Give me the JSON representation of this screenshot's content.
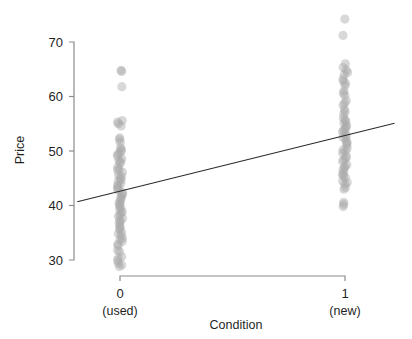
{
  "chart_data": {
    "type": "scatter",
    "title": "",
    "xlabel": "Condition",
    "ylabel": "Price",
    "xlim": [
      -0.22,
      1.26
    ],
    "ylim": [
      27.5,
      75.5
    ],
    "grid": false,
    "legend": null,
    "x_ticks": [
      {
        "value": 0,
        "label": "0",
        "sublabel": "(used)"
      },
      {
        "value": 1,
        "label": "1",
        "sublabel": "(new)"
      }
    ],
    "y_ticks": [
      {
        "value": 30,
        "label": "30"
      },
      {
        "value": 40,
        "label": "40"
      },
      {
        "value": 50,
        "label": "50"
      },
      {
        "value": 60,
        "label": "60"
      },
      {
        "value": 70,
        "label": "70"
      }
    ],
    "point_style": {
      "color": "#a8a8a8",
      "opacity": 0.45,
      "radius": 4.6,
      "jitter_x": 0.012
    },
    "series": [
      {
        "name": "Condition = 0 (used)",
        "x": 0,
        "values": [
          64.8,
          64.6,
          61.8,
          55.6,
          55.3,
          55.0,
          54.6,
          52.4,
          52.1,
          51.6,
          50.6,
          50.3,
          50.0,
          49.7,
          49.4,
          49.1,
          48.6,
          48.3,
          48.0,
          47.7,
          47.0,
          46.7,
          46.4,
          46.1,
          45.6,
          45.3,
          45.0,
          44.7,
          44.4,
          44.0,
          43.7,
          43.4,
          43.1,
          42.8,
          42.4,
          42.1,
          41.8,
          41.5,
          41.2,
          40.8,
          40.5,
          40.2,
          39.9,
          39.6,
          39.2,
          38.9,
          38.6,
          38.3,
          38.0,
          37.6,
          37.3,
          37.0,
          36.7,
          36.2,
          35.9,
          35.6,
          35.1,
          34.8,
          34.5,
          34.0,
          33.7,
          33.4,
          32.9,
          32.6,
          31.8,
          31.5,
          30.6,
          30.3,
          29.9,
          29.4,
          29.1,
          28.8
        ]
      },
      {
        "name": "Condition = 1 (new)",
        "x": 1,
        "values": [
          74.2,
          71.2,
          66.0,
          65.3,
          64.8,
          64.4,
          64.0,
          63.2,
          62.8,
          62.4,
          62.0,
          61.0,
          60.6,
          60.2,
          59.2,
          58.8,
          58.4,
          57.6,
          57.2,
          56.8,
          56.0,
          55.7,
          55.4,
          55.1,
          54.7,
          54.4,
          54.1,
          53.8,
          53.5,
          53.1,
          52.8,
          52.5,
          52.2,
          51.7,
          51.4,
          51.1,
          50.5,
          50.2,
          49.9,
          49.6,
          49.0,
          48.7,
          48.4,
          48.1,
          47.5,
          47.2,
          46.9,
          46.6,
          46.0,
          45.7,
          45.4,
          45.1,
          44.5,
          44.2,
          43.9,
          43.3,
          43.0,
          40.6,
          40.2,
          39.8
        ]
      }
    ],
    "fit_line": {
      "name": "least-squares fit",
      "x_start": -0.19,
      "y_start": 40.7,
      "x_end": 1.22,
      "y_end": 55.1,
      "color": "#2b2b2b"
    }
  }
}
